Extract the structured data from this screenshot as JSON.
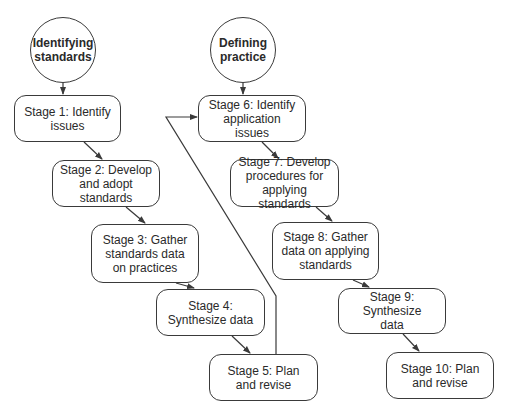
{
  "diagram": {
    "type": "flowchart",
    "tracks": [
      {
        "title": "Identifying standards",
        "stages": [
          {
            "label": "Stage 1: Identify issues"
          },
          {
            "label": "Stage 2: Develop and adopt standards"
          },
          {
            "label": "Stage 3: Gather standards data on practices"
          },
          {
            "label": "Stage 4: Synthesize data"
          },
          {
            "label": "Stage 5: Plan and revise"
          }
        ]
      },
      {
        "title": "Defining practice",
        "stages": [
          {
            "label": "Stage 6: Identify application issues"
          },
          {
            "label": "Stage 7: Develop procedures for applying standards"
          },
          {
            "label": "Stage 8: Gather data on applying standards"
          },
          {
            "label": "Stage 9: Synthesize data"
          },
          {
            "label": "Stage 10: Plan and revise"
          }
        ]
      }
    ],
    "edges": [
      {
        "from": "Identifying standards",
        "to": "Stage 1"
      },
      {
        "from": "Stage 1",
        "to": "Stage 2"
      },
      {
        "from": "Stage 2",
        "to": "Stage 3"
      },
      {
        "from": "Stage 3",
        "to": "Stage 4"
      },
      {
        "from": "Stage 4",
        "to": "Stage 5"
      },
      {
        "from": "Stage 5",
        "to": "Stage 6"
      },
      {
        "from": "Defining practice",
        "to": "Stage 6"
      },
      {
        "from": "Stage 6",
        "to": "Stage 7"
      },
      {
        "from": "Stage 7",
        "to": "Stage 8"
      },
      {
        "from": "Stage 8",
        "to": "Stage 9"
      },
      {
        "from": "Stage 9",
        "to": "Stage 10"
      }
    ],
    "colors": {
      "stroke": "#3a3a3a",
      "background": "#ffffff",
      "text": "#2a2a2a"
    }
  }
}
